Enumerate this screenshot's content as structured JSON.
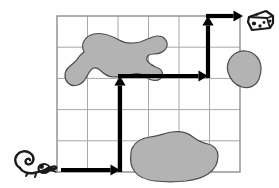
{
  "scene": {
    "title": "Mouse and cheese grid maze",
    "canvas": {
      "width": 279,
      "height": 188
    },
    "background_color": "#ffffff"
  },
  "grid": {
    "name": "maze-grid",
    "columns": 6,
    "rows": 5,
    "x": 57,
    "y": 16,
    "cell_width": 30.5,
    "cell_height": 31.2,
    "line_color": "#a8a8a8",
    "line_width": 1,
    "border_color": "#8d8d8d",
    "border_width": 1.4
  },
  "obstacles": [
    {
      "name": "obstacle-blob-upper-left",
      "label": "Irregular gray blob (upper-left region)",
      "fill": "#b3b3b3",
      "stroke": "#4d4d4d",
      "stroke_width": 1.2,
      "path": "M 84 52 C 80 44 85 36 94 34 C 103 32 112 36 119 40 C 126 44 132 44 140 42 C 147 40 152 36 158 36 C 164 36 168 41 167 46 C 166 51 160 54 154 54 C 149 54 146 56 147 60 C 148 64 154 66 158 68 C 163 70 164 76 160 79 C 156 82 150 80 146 77 C 142 74 138 73 133 74 C 126 75 120 77 114 77 C 108 77 104 74 101 71 C 98 68 95 67 92 69 C 88 72 87 78 83 82 C 79 86 72 87 68 83 C 64 79 64 72 68 68 C 72 64 76 62 78 58 C 80 55 82 54 84 52 Z"
    },
    {
      "name": "obstacle-blob-right",
      "label": "Rounded gray blob (right edge, second row)",
      "fill": "#b3b3b3",
      "stroke": "#4d4d4d",
      "stroke_width": 1.2,
      "path": "M 236 53 C 243 49 252 51 257 57 C 262 63 262 72 259 79 C 256 86 249 89 242 87 C 235 85 230 79 228 72 C 226 65 229 57 236 53 Z"
    },
    {
      "name": "obstacle-blob-bottom",
      "label": "Large gray blob (bottom, spanning rows 4-5)",
      "fill": "#b3b3b3",
      "stroke": "#4d4d4d",
      "stroke_width": 1.2,
      "path": "M 133 147 C 136 141 143 138 150 137 C 158 136 165 133 172 132 C 180 131 188 133 193 137 C 198 141 203 143 208 144 C 214 145 218 150 218 156 C 218 163 214 170 208 174 C 202 178 194 180 186 181 C 176 182 165 182 155 181 C 146 180 139 177 135 172 C 131 167 130 159 131 153 C 131 150 132 148 133 147 Z"
    }
  ],
  "path_arrow": {
    "name": "solution-path-arrow",
    "color": "#000000",
    "stroke_width": 4.2,
    "description": "Bold black path from mouse: right, up, right, up, right to cheese",
    "segments": [
      {
        "name": "segment-right-1",
        "from": [
          61,
          170
        ],
        "to": [
          120,
          170
        ],
        "direction": "right",
        "arrowhead": true
      },
      {
        "name": "segment-up-1",
        "from": [
          120,
          172
        ],
        "to": [
          120,
          76
        ],
        "direction": "up",
        "arrowhead": true
      },
      {
        "name": "segment-right-2",
        "from": [
          118,
          76
        ],
        "to": [
          208,
          76
        ],
        "direction": "right",
        "arrowhead": true
      },
      {
        "name": "segment-up-2",
        "from": [
          208,
          78
        ],
        "to": [
          208,
          16
        ],
        "direction": "up",
        "arrowhead": true
      },
      {
        "name": "segment-right-3",
        "from": [
          206,
          16
        ],
        "to": [
          243,
          16
        ],
        "direction": "right",
        "arrowhead": true
      }
    ]
  },
  "mouse": {
    "name": "mouse-icon",
    "label": "mouse",
    "color": "#1a1a1a",
    "x": 14,
    "y": 148,
    "width": 44,
    "height": 28
  },
  "cheese": {
    "name": "cheese-icon",
    "label": "cheese",
    "color": "#1a1a1a",
    "x": 246,
    "y": 9,
    "width": 29,
    "height": 24
  }
}
